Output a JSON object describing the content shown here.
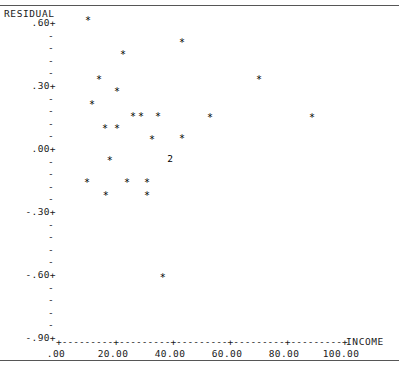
{
  "chart_data": {
    "type": "scatter",
    "title": "",
    "ylabel": "RESIDUAL",
    "xlabel": "INCOME",
    "xlim": [
      0,
      110
    ],
    "ylim": [
      -0.9,
      0.66
    ],
    "grid": false,
    "legend": "none",
    "y_ticks_labeled": [
      ".60+",
      ".30+",
      ".00+",
      "-.30+",
      "-.60+",
      "-.90+"
    ],
    "y_tick_values": [
      0.6,
      0.3,
      0.0,
      -0.3,
      -0.6,
      -0.9
    ],
    "y_minor_tick": "-",
    "x_tick_labels": [
      ".00",
      "20.00",
      "40.00",
      "60.00",
      "80.00",
      "100.00"
    ],
    "x_tick_values": [
      0,
      20,
      40,
      60,
      80,
      100
    ],
    "axis_line": "+---------+---------+---------+---------+---------+",
    "marker": "*",
    "overlap_marker": "2",
    "points": [
      {
        "label": "*",
        "x": 11.2,
        "y": 0.595
      },
      {
        "label": "*",
        "x": 23.5,
        "y": 0.435
      },
      {
        "label": "*",
        "x": 44.2,
        "y": 0.492
      },
      {
        "label": "*",
        "x": 15.1,
        "y": 0.312
      },
      {
        "label": "*",
        "x": 21.4,
        "y": 0.255
      },
      {
        "label": "*",
        "x": 12.6,
        "y": 0.193
      },
      {
        "label": "*",
        "x": 27.0,
        "y": 0.14
      },
      {
        "label": "*",
        "x": 29.8,
        "y": 0.14
      },
      {
        "label": "*",
        "x": 35.8,
        "y": 0.14
      },
      {
        "label": "*",
        "x": 54.0,
        "y": 0.135
      },
      {
        "label": "*",
        "x": 71.2,
        "y": 0.312
      },
      {
        "label": "*",
        "x": 89.8,
        "y": 0.135
      },
      {
        "label": "*",
        "x": 17.2,
        "y": 0.083
      },
      {
        "label": "*",
        "x": 21.4,
        "y": 0.083
      },
      {
        "label": "*",
        "x": 33.7,
        "y": 0.03
      },
      {
        "label": "*",
        "x": 44.2,
        "y": 0.035
      },
      {
        "label": "2",
        "x": 40.0,
        "y": -0.05
      },
      {
        "label": "*",
        "x": 18.9,
        "y": -0.073
      },
      {
        "label": "*",
        "x": 10.9,
        "y": -0.178
      },
      {
        "label": "*",
        "x": 24.9,
        "y": -0.178
      },
      {
        "label": "*",
        "x": 31.9,
        "y": -0.178
      },
      {
        "label": "*",
        "x": 17.5,
        "y": -0.24
      },
      {
        "label": "*",
        "x": 31.9,
        "y": -0.24
      },
      {
        "label": "*",
        "x": 37.5,
        "y": -0.63
      }
    ]
  }
}
